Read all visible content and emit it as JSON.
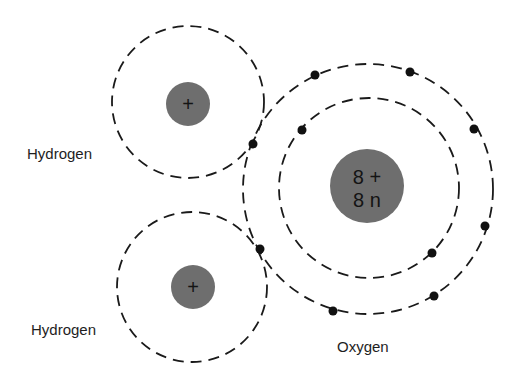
{
  "diagram": {
    "colors": {
      "background": "#ffffff",
      "nucleus": "#6e6e6e",
      "orbit": "#1a1a1a",
      "electron": "#111111",
      "text": "#1e1e1e"
    },
    "atoms": [
      {
        "id": "hydrogen-top",
        "label": "Hydrogen",
        "nucleus_text": "+",
        "nucleus": {
          "cx": 188,
          "cy": 104,
          "r": 22
        },
        "orbits": [
          {
            "cx": 188,
            "cy": 102,
            "r": 76
          }
        ],
        "label_pos": {
          "x": 27,
          "y": 159
        }
      },
      {
        "id": "hydrogen-bottom",
        "label": "Hydrogen",
        "nucleus_text": "+",
        "nucleus": {
          "cx": 193,
          "cy": 287,
          "r": 22
        },
        "orbits": [
          {
            "cx": 192,
            "cy": 287,
            "r": 75
          }
        ],
        "label_pos": {
          "x": 31,
          "y": 335
        }
      },
      {
        "id": "oxygen",
        "label": "Oxygen",
        "nucleus_text_line1": "8 +",
        "nucleus_text_line2": "8 n",
        "nucleus": {
          "cx": 367,
          "cy": 186,
          "r": 37
        },
        "orbits": [
          {
            "cx": 369,
            "cy": 188,
            "r": 90
          },
          {
            "cx": 368,
            "cy": 189,
            "r": 125
          }
        ],
        "label_pos": {
          "x": 337,
          "y": 352
        }
      }
    ],
    "electrons": [
      {
        "cx": 315,
        "cy": 75,
        "shell": "outer"
      },
      {
        "cx": 410,
        "cy": 72,
        "shell": "outer"
      },
      {
        "cx": 474,
        "cy": 129,
        "shell": "outer"
      },
      {
        "cx": 485,
        "cy": 226,
        "shell": "outer"
      },
      {
        "cx": 434,
        "cy": 296,
        "shell": "outer"
      },
      {
        "cx": 333,
        "cy": 311,
        "shell": "outer"
      },
      {
        "cx": 302,
        "cy": 130,
        "shell": "inner"
      },
      {
        "cx": 432,
        "cy": 253,
        "shell": "inner"
      },
      {
        "cx": 253,
        "cy": 144,
        "shell": "shared"
      },
      {
        "cx": 260,
        "cy": 249,
        "shell": "shared"
      }
    ]
  }
}
